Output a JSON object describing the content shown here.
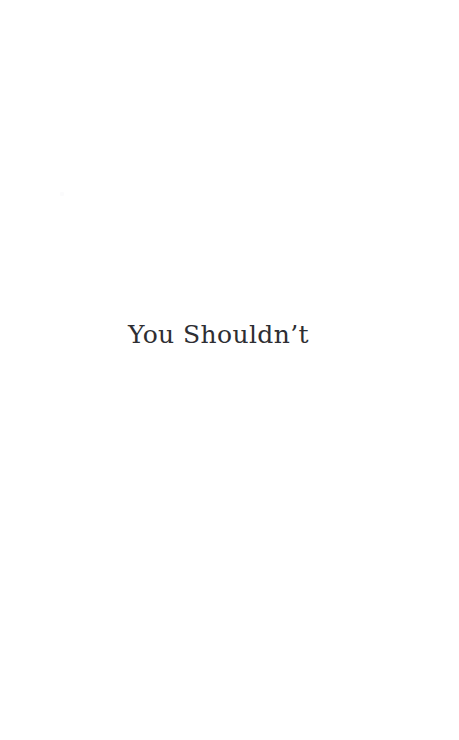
{
  "page": {
    "background_color": "#ffffff",
    "width": 459,
    "height": 740,
    "kind": "book-part-title-page"
  },
  "title_block": {
    "title": "You Shouldn’t",
    "text_color": "#2e2e33"
  },
  "artifacts": {
    "scan_speck_color": "#fbfbfc"
  }
}
